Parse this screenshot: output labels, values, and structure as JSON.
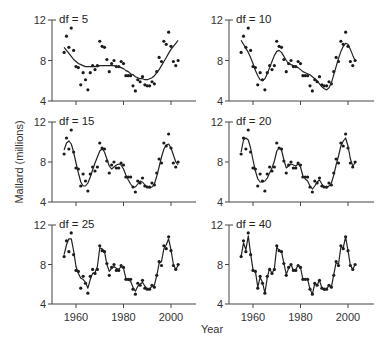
{
  "chart_data": {
    "type": "scatter",
    "title": "",
    "xlabel": "Year",
    "ylabel": "Mallard (millions)",
    "xlim": [
      1950,
      2011
    ],
    "ylim": [
      4,
      12
    ],
    "x_ticks": [
      1960,
      1980,
      2000
    ],
    "y_ticks": [
      4,
      8,
      12
    ],
    "grid": false,
    "legend": null,
    "years": [
      1955,
      1956,
      1957,
      1958,
      1959,
      1960,
      1961,
      1962,
      1963,
      1964,
      1965,
      1966,
      1967,
      1968,
      1969,
      1970,
      1971,
      1972,
      1973,
      1974,
      1975,
      1976,
      1977,
      1978,
      1979,
      1980,
      1981,
      1982,
      1983,
      1984,
      1985,
      1986,
      1987,
      1988,
      1989,
      1990,
      1991,
      1992,
      1993,
      1994,
      1995,
      1996,
      1997,
      1998,
      1999,
      2000,
      2001,
      2002,
      2003
    ],
    "observed": [
      8.8,
      10.4,
      9.3,
      11.2,
      9.0,
      7.4,
      7.3,
      5.6,
      6.8,
      6.1,
      5.1,
      6.8,
      7.5,
      7.1,
      7.5,
      9.9,
      9.4,
      9.3,
      8.1,
      6.9,
      7.7,
      8.0,
      7.4,
      7.4,
      7.9,
      7.7,
      6.5,
      6.5,
      6.5,
      5.5,
      5.0,
      6.1,
      5.9,
      6.4,
      5.6,
      5.5,
      5.5,
      5.9,
      5.7,
      6.9,
      8.3,
      7.9,
      9.9,
      9.6,
      10.8,
      9.4,
      7.9,
      7.5,
      8.0
    ],
    "panels": [
      {
        "label": "df = 5",
        "df": 5
      },
      {
        "label": "df = 10",
        "df": 10
      },
      {
        "label": "df = 15",
        "df": 15
      },
      {
        "label": "df = 20",
        "df": 20
      },
      {
        "label": "df = 25",
        "df": 25
      },
      {
        "label": "df = 40",
        "df": 40
      }
    ],
    "smoothed": {
      "df5": [
        9.3,
        9.0,
        8.7,
        8.4,
        8.1,
        7.9,
        7.7,
        7.6,
        7.5,
        7.4,
        7.4,
        7.4,
        7.4,
        7.4,
        7.4,
        7.5,
        7.5,
        7.5,
        7.5,
        7.5,
        7.5,
        7.5,
        7.4,
        7.4,
        7.3,
        7.2,
        7.0,
        6.9,
        6.7,
        6.6,
        6.4,
        6.3,
        6.2,
        6.2,
        6.1,
        6.1,
        6.2,
        6.3,
        6.5,
        6.8,
        7.1,
        7.5,
        7.9,
        8.3,
        8.7,
        9.1,
        9.4,
        9.7,
        10.0
      ],
      "df10": [
        10.0,
        9.6,
        9.2,
        8.8,
        8.3,
        7.7,
        7.0,
        6.5,
        6.1,
        6.0,
        6.2,
        6.7,
        7.3,
        7.9,
        8.5,
        8.9,
        9.0,
        8.8,
        8.4,
        8.0,
        7.7,
        7.6,
        7.5,
        7.4,
        7.3,
        7.1,
        6.9,
        6.8,
        6.7,
        6.6,
        6.4,
        6.2,
        6.0,
        5.7,
        5.4,
        5.2,
        5.1,
        5.3,
        5.8,
        6.6,
        7.4,
        8.2,
        8.9,
        9.4,
        9.7,
        9.6,
        9.1,
        8.5,
        8.0
      ],
      "df15": [
        9.2,
        9.9,
        10.1,
        9.8,
        9.0,
        7.9,
        6.9,
        6.0,
        5.6,
        5.6,
        5.9,
        6.5,
        7.2,
        7.9,
        8.5,
        9.1,
        9.3,
        9.0,
        8.3,
        7.6,
        7.3,
        7.5,
        7.7,
        7.8,
        7.7,
        7.3,
        6.7,
        6.2,
        5.8,
        5.5,
        5.5,
        5.8,
        6.1,
        6.0,
        5.7,
        5.5,
        5.4,
        5.5,
        5.8,
        6.6,
        7.5,
        8.5,
        9.3,
        9.7,
        9.8,
        9.4,
        8.7,
        8.0,
        7.7
      ],
      "df20": [
        9.0,
        10.2,
        10.4,
        10.2,
        9.4,
        8.2,
        7.1,
        6.3,
        6.0,
        6.0,
        6.1,
        6.4,
        6.9,
        7.4,
        8.1,
        9.1,
        9.4,
        9.2,
        8.2,
        7.4,
        7.6,
        7.8,
        7.7,
        7.6,
        7.8,
        7.5,
        6.6,
        6.3,
        6.1,
        5.6,
        5.3,
        5.6,
        6.0,
        6.2,
        5.8,
        5.5,
        5.4,
        5.6,
        5.9,
        6.7,
        7.7,
        8.6,
        9.6,
        10.1,
        10.4,
        9.6,
        8.3,
        7.6,
        7.9
      ],
      "df25": [
        9.0,
        10.0,
        10.6,
        10.6,
        9.4,
        7.8,
        7.1,
        6.6,
        6.5,
        6.2,
        5.6,
        6.5,
        7.1,
        7.2,
        7.8,
        9.7,
        9.6,
        9.3,
        8.0,
        7.3,
        7.6,
        7.8,
        7.6,
        7.5,
        7.8,
        7.6,
        6.6,
        6.4,
        6.3,
        5.7,
        5.3,
        5.8,
        6.0,
        6.2,
        5.8,
        5.5,
        5.5,
        5.8,
        5.9,
        6.9,
        8.1,
        8.3,
        9.6,
        10.0,
        10.6,
        9.5,
        8.0,
        7.5,
        7.9
      ],
      "df40": [
        8.8,
        10.2,
        9.5,
        10.9,
        9.1,
        7.5,
        7.3,
        5.7,
        6.7,
        6.2,
        5.1,
        6.7,
        7.6,
        7.1,
        7.6,
        9.8,
        9.4,
        9.3,
        8.1,
        7.0,
        7.6,
        8.0,
        7.4,
        7.5,
        7.9,
        7.7,
        6.5,
        6.5,
        6.5,
        5.5,
        5.0,
        6.1,
        5.9,
        6.4,
        5.6,
        5.4,
        5.5,
        5.9,
        5.7,
        7.0,
        8.2,
        8.0,
        9.8,
        9.7,
        10.8,
        9.4,
        7.9,
        7.5,
        8.0
      ]
    }
  }
}
